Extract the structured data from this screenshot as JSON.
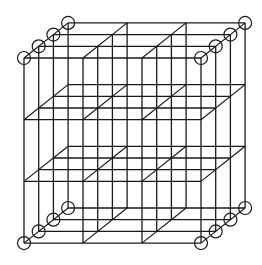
{
  "diagram": {
    "type": "cubic-lattice",
    "size": {
      "nx": 4,
      "ny": 4,
      "nz": 4
    },
    "front_origin": {
      "x": 24,
      "y": 58
    },
    "spacing": {
      "x": 59,
      "y": 61.7
    },
    "depth_offset": {
      "dx": 14.7,
      "dy": -11.7
    },
    "atom_radius": 6.5,
    "colors": {
      "line": "#1a1a1a",
      "background": "#ffffff"
    }
  }
}
